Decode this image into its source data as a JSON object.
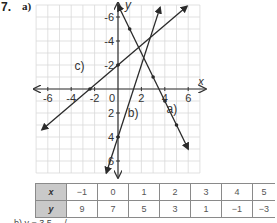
{
  "question": {
    "number": "7.",
    "part_label": "a)",
    "next_part_partial": "b)    y = 3.5 ... /"
  },
  "chart_data": {
    "type": "line",
    "title": "",
    "xlabel": "x",
    "ylabel": "y",
    "xlim": [
      -7,
      7
    ],
    "ylim": [
      -7,
      7
    ],
    "grid": true,
    "x_ticks": [
      -6,
      -4,
      -2,
      0,
      2,
      4,
      6
    ],
    "y_ticks": [
      -6,
      -4,
      -2,
      2,
      4,
      6
    ],
    "tick_labels_x": [
      "-6",
      "-4",
      "-2",
      "0",
      "2",
      "4",
      "6"
    ],
    "tick_labels_y": [
      "6",
      "4",
      "2",
      "-2",
      "-4",
      "-6"
    ],
    "series": [
      {
        "name": "a)",
        "equation": "y = -2x + 7",
        "points": [
          [
            0,
            7
          ],
          [
            1,
            5
          ],
          [
            2,
            3
          ],
          [
            3,
            1
          ],
          [
            4,
            -1
          ],
          [
            5,
            -3
          ],
          [
            6,
            -5
          ]
        ],
        "marked_points": [
          [
            1,
            5
          ],
          [
            3,
            1
          ],
          [
            4,
            -1
          ],
          [
            5,
            -3
          ]
        ]
      },
      {
        "name": "b)",
        "equation": "y = 3x - 4",
        "points": [
          [
            -1,
            -7
          ],
          [
            0,
            -4
          ],
          [
            2,
            2
          ],
          [
            3.6,
            6.8
          ]
        ],
        "marked_points": [
          [
            0,
            -4
          ]
        ]
      },
      {
        "name": "c)",
        "equation": "y = 0.83x + 2",
        "points": [
          [
            -6.5,
            -3.4
          ],
          [
            -2.4,
            0
          ],
          [
            0,
            2
          ],
          [
            5.9,
            6.9
          ]
        ],
        "marked_points": [
          [
            -2.4,
            0
          ],
          [
            0,
            2
          ]
        ]
      }
    ],
    "line_labels": [
      {
        "text": "a)",
        "at": [
          4.6,
          -2
        ]
      },
      {
        "text": "b)",
        "at": [
          1.3,
          -2.3
        ]
      },
      {
        "text": "c)",
        "at": [
          -3.3,
          1.6
        ]
      }
    ]
  },
  "table": {
    "row_headers": [
      "x",
      "y"
    ],
    "x_values": [
      "−1",
      "0",
      "1",
      "2",
      "3",
      "4",
      "5"
    ],
    "y_values": [
      "9",
      "7",
      "5",
      "3",
      "1",
      "−1",
      "−3"
    ]
  },
  "colors": {
    "grid": "#d9d9d9",
    "axis": "#333333",
    "line": "#2a2a2a",
    "table_header_bg": "#c9c9c9",
    "table_border": "#8a8a8a"
  }
}
